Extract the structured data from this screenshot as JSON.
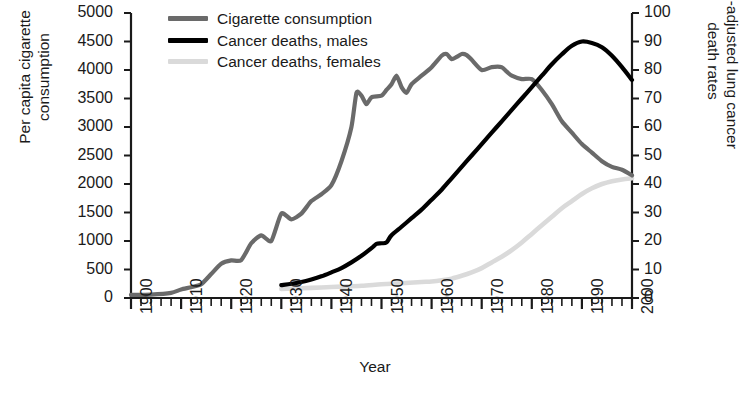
{
  "chart_data": {
    "type": "line",
    "title": "",
    "xlabel": "Year",
    "ylabel_left": "Per capita cigarette\nconsumption",
    "ylabel_right": "Age-adjusted lung cancer\ndeath rates",
    "xlim": [
      1900,
      2000
    ],
    "xticks": [
      "1900",
      "1910",
      "1920",
      "1930",
      "1940",
      "1950",
      "1960",
      "1970",
      "1980",
      "1990",
      "2000"
    ],
    "xminor_step": 2,
    "ylim_left": [
      0,
      5000
    ],
    "yticks_left": [
      "0",
      "500",
      "1000",
      "1500",
      "2000",
      "2500",
      "3000",
      "3500",
      "4000",
      "4500",
      "5000"
    ],
    "ylim_right": [
      0,
      100
    ],
    "yticks_right": [
      "0",
      "10",
      "20",
      "30",
      "40",
      "50",
      "60",
      "70",
      "80",
      "90",
      "100"
    ],
    "grid": false,
    "legend_position": "top-left",
    "series": [
      {
        "name": "Cigarette consumption",
        "axis": "left",
        "color": "#6a6a6a",
        "x": [
          1900,
          1904,
          1908,
          1910,
          1912,
          1914,
          1916,
          1918,
          1920,
          1922,
          1924,
          1926,
          1928,
          1930,
          1932,
          1934,
          1936,
          1938,
          1940,
          1942,
          1944,
          1945,
          1946,
          1947,
          1948,
          1950,
          1951,
          1952,
          1953,
          1954,
          1955,
          1956,
          1958,
          1960,
          1962,
          1963,
          1964,
          1965,
          1966,
          1967,
          1968,
          1970,
          1972,
          1974,
          1975,
          1976,
          1978,
          1980,
          1982,
          1984,
          1986,
          1988,
          1990,
          1992,
          1994,
          1996,
          1998,
          2000
        ],
        "values": [
          55,
          60,
          90,
          150,
          190,
          240,
          420,
          600,
          660,
          665,
          960,
          1100,
          1000,
          1480,
          1380,
          1480,
          1700,
          1820,
          1980,
          2400,
          3000,
          3600,
          3550,
          3400,
          3520,
          3550,
          3650,
          3750,
          3900,
          3700,
          3600,
          3750,
          3900,
          4050,
          4250,
          4280,
          4190,
          4230,
          4280,
          4260,
          4180,
          4000,
          4050,
          4050,
          3970,
          3900,
          3840,
          3840,
          3650,
          3400,
          3100,
          2900,
          2700,
          2550,
          2400,
          2300,
          2250,
          2150
        ],
        "peak_value": 4280,
        "peak_year": 1963,
        "end_value": 2150
      },
      {
        "name": "Cancer deaths, males",
        "axis": "right",
        "color": "#000000",
        "x": [
          1930,
          1932,
          1934,
          1936,
          1938,
          1940,
          1942,
          1944,
          1946,
          1948,
          1949,
          1950,
          1951,
          1952,
          1954,
          1956,
          1958,
          1960,
          1962,
          1964,
          1966,
          1968,
          1970,
          1972,
          1974,
          1976,
          1978,
          1980,
          1982,
          1984,
          1986,
          1988,
          1990,
          1992,
          1994,
          1996,
          1998,
          2000
        ],
        "values": [
          4.5,
          5,
          5.6,
          6.5,
          7.6,
          9,
          10.5,
          12.5,
          14.8,
          17.5,
          19,
          19.2,
          19.5,
          22,
          25,
          28,
          31,
          34.5,
          38,
          42,
          46,
          50,
          54,
          58,
          62,
          66,
          70,
          74,
          78,
          82,
          85.5,
          88.5,
          90,
          89.5,
          88,
          85,
          81,
          76.5
        ],
        "peak_value": 90,
        "peak_year": 1990,
        "end_value": 76.5
      },
      {
        "name": "Cancer deaths, females",
        "axis": "right",
        "color": "#dadada",
        "x": [
          1930,
          1934,
          1938,
          1942,
          1946,
          1950,
          1954,
          1958,
          1960,
          1962,
          1964,
          1966,
          1968,
          1970,
          1972,
          1974,
          1976,
          1978,
          1980,
          1982,
          1984,
          1986,
          1988,
          1990,
          1992,
          1994,
          1996,
          1998,
          2000
        ],
        "values": [
          3.2,
          3.4,
          3.7,
          4,
          4.3,
          4.8,
          5.2,
          5.6,
          5.8,
          6.2,
          6.8,
          7.8,
          9,
          10.5,
          12.5,
          14.5,
          16.8,
          19.5,
          22.5,
          25.5,
          28.5,
          31.5,
          34,
          36.5,
          38.5,
          40,
          41,
          41.6,
          42
        ],
        "peak_value": 42,
        "peak_year": 2000,
        "end_value": 42
      }
    ]
  },
  "legend": {
    "items": [
      {
        "label": "Cigarette consumption",
        "color": "#6a6a6a"
      },
      {
        "label": "Cancer deaths, males",
        "color": "#000000"
      },
      {
        "label": "Cancer deaths, females",
        "color": "#dadada"
      }
    ]
  },
  "axes": {
    "xlabel": "Year",
    "ylabel_left": "Per capita cigarette\nconsumption",
    "ylabel_right": "Age-adjusted lung cancer\ndeath rates"
  }
}
